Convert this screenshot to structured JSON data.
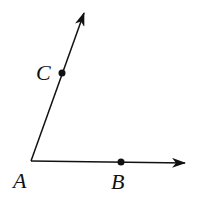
{
  "diagram": {
    "type": "angle",
    "vertex": {
      "label": "A",
      "x": 31,
      "y": 161
    },
    "points": [
      {
        "label": "C",
        "x": 62,
        "y": 73,
        "on_ray": "AC"
      },
      {
        "label": "B",
        "x": 121,
        "y": 162,
        "on_ray": "AB"
      }
    ],
    "rays": [
      {
        "name": "AC",
        "from": [
          31,
          161
        ],
        "to": [
          84,
          13
        ]
      },
      {
        "name": "AB",
        "from": [
          31,
          161
        ],
        "to": [
          185,
          163
        ]
      }
    ],
    "labels": {
      "A": "A",
      "B": "B",
      "C": "C"
    },
    "stroke_color": "#111111"
  }
}
